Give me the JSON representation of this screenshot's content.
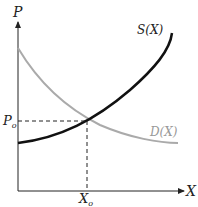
{
  "diagram": {
    "type": "supply-demand",
    "axis_labels": {
      "y": "P",
      "x": "X"
    },
    "curves": [
      {
        "name": "S(X)",
        "label": "S(X)",
        "color": "#111111",
        "description": "upward sloping supply curve"
      },
      {
        "name": "D(X)",
        "label": "D(X)",
        "color": "#aaaaaa",
        "description": "downward sloping demand curve"
      }
    ],
    "equilibrium": {
      "price_label": "P",
      "price_sub": "o",
      "quantity_label": "X",
      "quantity_sub": "o"
    }
  }
}
